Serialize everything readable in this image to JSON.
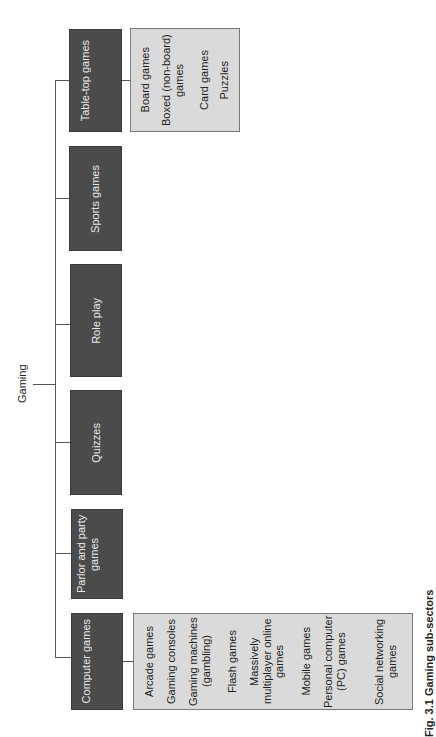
{
  "diagram": {
    "root": {
      "label": "Gaming"
    },
    "categories": [
      {
        "label": "Table-top games",
        "children": [
          "Board games",
          "Boxed (non-board) games",
          "Card games",
          "Puzzles"
        ]
      },
      {
        "label": "Sports games",
        "children": []
      },
      {
        "label": "Role play",
        "children": []
      },
      {
        "label": "Quizzes",
        "children": []
      },
      {
        "label": "Parlor and party games",
        "children": []
      },
      {
        "label": "Computer games",
        "children": [
          "Arcade games",
          "Gaming consoles",
          "Gaming machines (gambling)",
          "Flash games",
          "Massively multiplayer online games",
          "Mobile games",
          "Personal computer (PC) games",
          "Social networking games"
        ]
      }
    ],
    "caption": "Fig. 3.1 Gaming sub-sectors",
    "colors": {
      "category_box": "#4b4b4b",
      "category_text": "#e8e8e8",
      "subitem_box": "#dadada",
      "subitem_border": "#7a7a7a",
      "connector": "#555555"
    },
    "orientation": "rotated 90° counter-clockwise (text reads bottom-to-top)"
  }
}
